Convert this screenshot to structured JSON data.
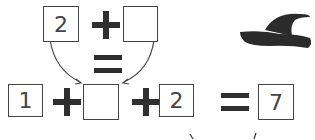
{
  "puzzle": {
    "top_row": {
      "left_box": "2",
      "operator": "+",
      "right_box": ""
    },
    "middle_equals": "=",
    "bottom_row": {
      "box1": "1",
      "op1": "+",
      "box2": "",
      "op2": "+",
      "box3": "2",
      "equals": "=",
      "result_box": "7"
    },
    "decoration": "witch-hat"
  }
}
